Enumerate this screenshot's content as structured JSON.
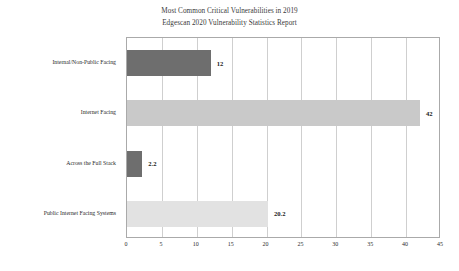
{
  "chart_data": {
    "type": "bar",
    "orientation": "horizontal",
    "title": "Most Common Critical Vulnerabilities in 2019",
    "subtitle": "Edgescan 2020 Vulnerability Statistics Report",
    "xlabel": "",
    "ylabel": "",
    "categories": [
      "Internal/Non-Public Facing",
      "Internet Facing",
      "Across the Full Stack",
      "Public Internet Facing Systems"
    ],
    "values": [
      12,
      42,
      2.2,
      20.2
    ],
    "value_labels": [
      "12",
      "42",
      "2.2",
      "20.2"
    ],
    "bar_colors": [
      "#6e6e6e",
      "#c9c9c9",
      "#6e6e6e",
      "#e2e2e2"
    ],
    "xlim": [
      0,
      45
    ],
    "xticks": [
      0,
      5,
      10,
      15,
      20,
      25,
      30,
      35,
      40,
      45
    ],
    "xtick_labels": [
      "0",
      "5",
      "10",
      "15",
      "20",
      "25",
      "30",
      "35",
      "40",
      "45"
    ],
    "grid": "vertical",
    "legend": "none",
    "frame_color": "#aaaaaa",
    "gridline_color": "#cfcfcf"
  }
}
